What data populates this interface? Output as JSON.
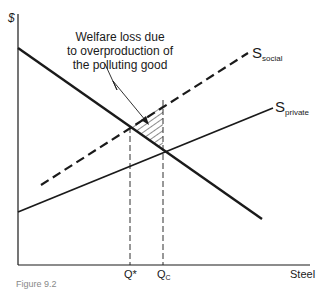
{
  "diagram": {
    "y_axis_label": "$",
    "x_axis_label": "Steel",
    "annotation": {
      "lines": [
        "Welfare loss due",
        "to overproduction of",
        "the polluting good"
      ]
    },
    "curves": {
      "demand": {
        "label": "",
        "style": "solid-thick"
      },
      "supply_social": {
        "label_main": "S",
        "label_sub": "social",
        "style": "dashed"
      },
      "supply_private": {
        "label_main": "S",
        "label_sub": "private",
        "style": "solid"
      }
    },
    "quantities": {
      "q_star": "Q*",
      "q_c_main": "Q",
      "q_c_sub": "C"
    },
    "caption": "Figure 9.2",
    "colors": {
      "ink": "#1a1a1a",
      "background": "#ffffff"
    }
  }
}
